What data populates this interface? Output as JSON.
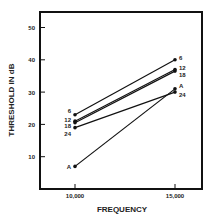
{
  "chart_data": {
    "type": "line",
    "title": "",
    "xlabel": "FREQUENCY",
    "ylabel": "THRESHOLD IN dB",
    "x": [
      10000,
      15000
    ],
    "x_tick_labels": [
      "10,000",
      "15,000"
    ],
    "y_ticks": [
      10,
      20,
      30,
      40,
      50
    ],
    "ylim": [
      0,
      55
    ],
    "grid": false,
    "series": [
      {
        "name": "6",
        "values": [
          23,
          40
        ]
      },
      {
        "name": "12",
        "values": [
          21,
          37
        ]
      },
      {
        "name": "18",
        "values": [
          20.5,
          36.5
        ]
      },
      {
        "name": "24",
        "values": [
          19,
          30
        ]
      },
      {
        "name": "A",
        "values": [
          7,
          31
        ]
      }
    ]
  }
}
